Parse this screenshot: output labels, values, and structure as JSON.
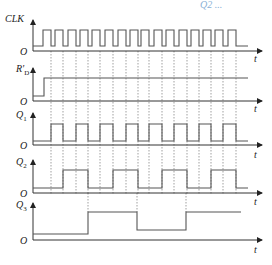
{
  "title_fragment": "Q2 ...",
  "axis": {
    "x_label": "t",
    "origin_label": "O"
  },
  "signals": [
    {
      "id": "clk",
      "label": "CLK",
      "sub": ""
    },
    {
      "id": "rd",
      "label": "R'",
      "sub": "D"
    },
    {
      "id": "q1",
      "label": "Q",
      "sub": "1"
    },
    {
      "id": "q2",
      "label": "Q",
      "sub": "2"
    },
    {
      "id": "q3",
      "label": "Q",
      "sub": "3"
    }
  ],
  "chart_data": {
    "type": "timing",
    "title": "",
    "clock_falling_edges_px": [
      51,
      63,
      76,
      88,
      100,
      113,
      126,
      138,
      149,
      162,
      174,
      187,
      199,
      211,
      223,
      236
    ],
    "waveforms": {
      "CLK": "16 clock pulses, square wave",
      "R'D": [
        0,
        1
      ],
      "Q1": [
        0,
        1,
        0,
        1,
        0,
        1,
        0,
        1,
        0,
        1,
        0,
        1,
        0,
        1,
        0,
        1,
        0
      ],
      "Q2": [
        0,
        0,
        1,
        1,
        0,
        0,
        1,
        1,
        0,
        0,
        1,
        1,
        0,
        0,
        1,
        1,
        0
      ],
      "Q3": [
        0,
        0,
        0,
        0,
        1,
        1,
        1,
        1,
        0,
        0,
        0,
        0,
        1,
        1,
        1,
        1
      ]
    },
    "xlabel": "t"
  }
}
